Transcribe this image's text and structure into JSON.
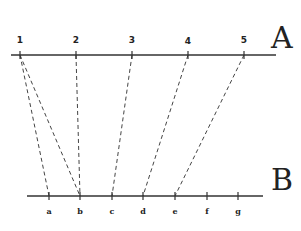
{
  "diagram": {
    "line_a": {
      "label": "A",
      "y": 55,
      "x1": 11,
      "x2": 276,
      "ticks": [
        {
          "label": "1",
          "x": 20
        },
        {
          "label": "2",
          "x": 76
        },
        {
          "label": "3",
          "x": 132
        },
        {
          "label": "4",
          "x": 188
        },
        {
          "label": "5",
          "x": 244
        }
      ]
    },
    "line_b": {
      "label": "B",
      "y": 196,
      "x1": 27,
      "x2": 263,
      "ticks": [
        {
          "label": "a",
          "x": 49
        },
        {
          "label": "b",
          "x": 80
        },
        {
          "label": "c",
          "x": 112
        },
        {
          "label": "d",
          "x": 143
        },
        {
          "label": "e",
          "x": 175
        },
        {
          "label": "f",
          "x": 207
        },
        {
          "label": "g",
          "x": 238
        }
      ]
    },
    "connections": [
      {
        "from": "1",
        "to": "a"
      },
      {
        "from": "1",
        "to": "b"
      },
      {
        "from": "2",
        "to": "b"
      },
      {
        "from": "3",
        "to": "c"
      },
      {
        "from": "4",
        "to": "d"
      },
      {
        "from": "5",
        "to": "e"
      }
    ],
    "colors": {
      "line": "#333333",
      "dash": "#444444",
      "background": "#ffffff"
    }
  }
}
